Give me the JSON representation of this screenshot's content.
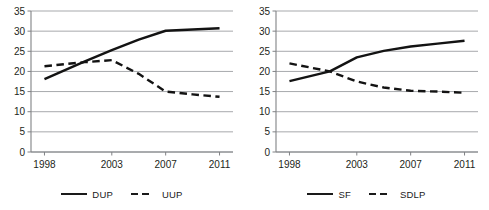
{
  "figure": {
    "panels": [
      "left",
      "right"
    ]
  },
  "chart_data": [
    {
      "type": "line",
      "title": "",
      "xlabel": "",
      "ylabel": "",
      "x": [
        1998,
        2001,
        2003,
        2005,
        2007,
        2009,
        2011
      ],
      "xtick_values": [
        1998,
        2003,
        2007,
        2011
      ],
      "xtick_labels": [
        "1998",
        "2003",
        "2007",
        "2011"
      ],
      "ytick_values": [
        0,
        5,
        10,
        15,
        20,
        25,
        30,
        35
      ],
      "ytick_labels": [
        "0",
        "5",
        "10",
        "15",
        "20",
        "25",
        "30",
        "35"
      ],
      "ylim": [
        0,
        35
      ],
      "xlim": [
        1997,
        2012
      ],
      "grid": true,
      "legend_position": "bottom",
      "series": [
        {
          "name": "DUP",
          "style": "solid",
          "values": [
            18.1,
            22.5,
            25.3,
            27.9,
            30.1,
            30.4,
            30.7
          ]
        },
        {
          "name": "UUP",
          "style": "dashed",
          "values": [
            21.3,
            22.3,
            22.8,
            19.4,
            15.0,
            14.3,
            13.7
          ]
        }
      ]
    },
    {
      "type": "line",
      "title": "",
      "xlabel": "",
      "ylabel": "",
      "x": [
        1998,
        2001,
        2003,
        2005,
        2007,
        2009,
        2011
      ],
      "xtick_values": [
        1998,
        2003,
        2007,
        2011
      ],
      "xtick_labels": [
        "1998",
        "2003",
        "2007",
        "2011"
      ],
      "ytick_values": [
        0,
        5,
        10,
        15,
        20,
        25,
        30,
        35
      ],
      "ytick_labels": [
        "0",
        "5",
        "10",
        "15",
        "20",
        "25",
        "30",
        "35"
      ],
      "ylim": [
        0,
        35
      ],
      "xlim": [
        1997,
        2012
      ],
      "grid": true,
      "legend_position": "bottom",
      "series": [
        {
          "name": "SF",
          "style": "solid",
          "values": [
            17.6,
            20.0,
            23.5,
            25.1,
            26.2,
            26.9,
            27.6
          ]
        },
        {
          "name": "SDLP",
          "style": "dashed",
          "values": [
            22.0,
            20.0,
            17.5,
            16.0,
            15.2,
            15.0,
            14.7
          ]
        }
      ]
    }
  ]
}
